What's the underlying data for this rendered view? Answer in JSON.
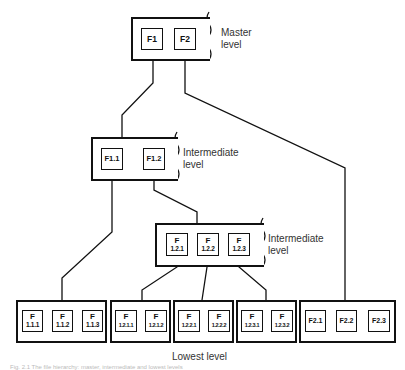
{
  "levels": {
    "master": {
      "label_line1": "Master",
      "label_line2": "level"
    },
    "intermediate1": {
      "label_line1": "Intermediate",
      "label_line2": "level"
    },
    "intermediate2": {
      "label_line1": "Intermediate",
      "label_line2": "level"
    },
    "lowest": {
      "label": "Lowest level"
    }
  },
  "master": {
    "nodes": [
      {
        "id": "F1",
        "text": "F1"
      },
      {
        "id": "F2",
        "text": "F2"
      }
    ]
  },
  "intermediate1": {
    "nodes": [
      {
        "id": "F1.1",
        "text": "F1.1"
      },
      {
        "id": "F1.2",
        "text": "F1.2"
      }
    ]
  },
  "intermediate2": {
    "nodes": [
      {
        "id": "F1.2.1",
        "top": "F",
        "bottom": "1.2.1"
      },
      {
        "id": "F1.2.2",
        "top": "F",
        "bottom": "1.2.2"
      },
      {
        "id": "F1.2.3",
        "top": "F",
        "bottom": "1.2.3"
      }
    ]
  },
  "lowest": {
    "groups": [
      {
        "nodes": [
          {
            "top": "F",
            "bottom": "1.1.1"
          },
          {
            "top": "F",
            "bottom": "1.1.2"
          },
          {
            "top": "F",
            "bottom": "1.1.3"
          }
        ]
      },
      {
        "nodes": [
          {
            "top": "F",
            "bottom": "1.2.1.1"
          },
          {
            "top": "F",
            "bottom": "1.2.1.2"
          }
        ]
      },
      {
        "nodes": [
          {
            "top": "F",
            "bottom": "1.2.2.1"
          },
          {
            "top": "F",
            "bottom": "1.2.2.2"
          }
        ]
      },
      {
        "nodes": [
          {
            "top": "F",
            "bottom": "1.2.3.1"
          },
          {
            "top": "F",
            "bottom": "1.2.3.2"
          }
        ]
      },
      {
        "nodes": [
          {
            "text": "F2.1"
          },
          {
            "text": "F2.2"
          },
          {
            "text": "F2.3"
          }
        ]
      }
    ]
  },
  "caption": "Fig. 2.1 The file hierarchy: master, intermediate and lowest levels"
}
